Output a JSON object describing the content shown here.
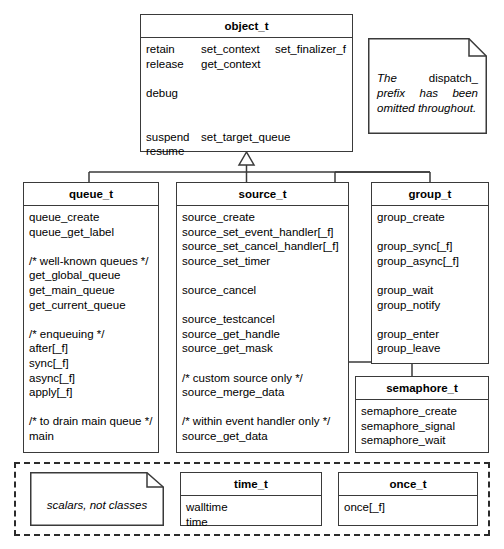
{
  "diagram": {
    "ink_color": "#3a3a3a",
    "background": "#ffffff"
  },
  "root_class": {
    "name": "object_t",
    "member_rows": [
      [
        "retain",
        "set_context",
        "set_finalizer_f"
      ],
      [
        "release",
        "get_context",
        ""
      ],
      [
        "",
        "",
        ""
      ],
      [
        "debug",
        "",
        ""
      ],
      [
        "",
        "",
        ""
      ],
      [
        "suspend",
        "set_target_queue",
        ""
      ],
      [
        "resume",
        "",
        ""
      ]
    ]
  },
  "note_prefix": {
    "name": "dispatch-prefix-note",
    "text_before": "The ",
    "text_roman": "dispatch_",
    "text_after": " prefix has been omitted throughout."
  },
  "classes": [
    {
      "name": "queue_t",
      "members": [
        "queue_create",
        "queue_get_label",
        "",
        "/* well-known queues */",
        "get_global_queue",
        "get_main_queue",
        "get_current_queue",
        "",
        "/* enqueuing */",
        "after[_f]",
        "sync[_f]",
        "async[_f]",
        "apply[_f]",
        "",
        "/* to drain main queue */",
        "main"
      ]
    },
    {
      "name": "source_t",
      "members": [
        "source_create",
        "source_set_event_handler[_f]",
        "source_set_cancel_handler[_f]",
        "source_set_timer",
        "",
        "source_cancel",
        "",
        "source_testcancel",
        "source_get_handle",
        "source_get_mask",
        "",
        "/* custom source only */",
        "source_merge_data",
        "",
        "/* within event handler only */",
        "source_get_data"
      ]
    },
    {
      "name": "group_t",
      "members": [
        "group_create",
        "",
        "group_sync[_f]",
        "group_async[_f]",
        "",
        "group_wait",
        "group_notify",
        "",
        "group_enter",
        "group_leave"
      ]
    },
    {
      "name": "semaphore_t",
      "members": [
        "semaphore_create",
        "semaphore_signal",
        "semaphore_wait"
      ]
    }
  ],
  "scalar_group": {
    "note": {
      "name": "scalars-note",
      "text": "scalars, not classes"
    },
    "classes": [
      {
        "name": "time_t",
        "members": [
          "walltime",
          "time"
        ]
      },
      {
        "name": "once_t",
        "members": [
          "once[_f]"
        ]
      }
    ]
  }
}
